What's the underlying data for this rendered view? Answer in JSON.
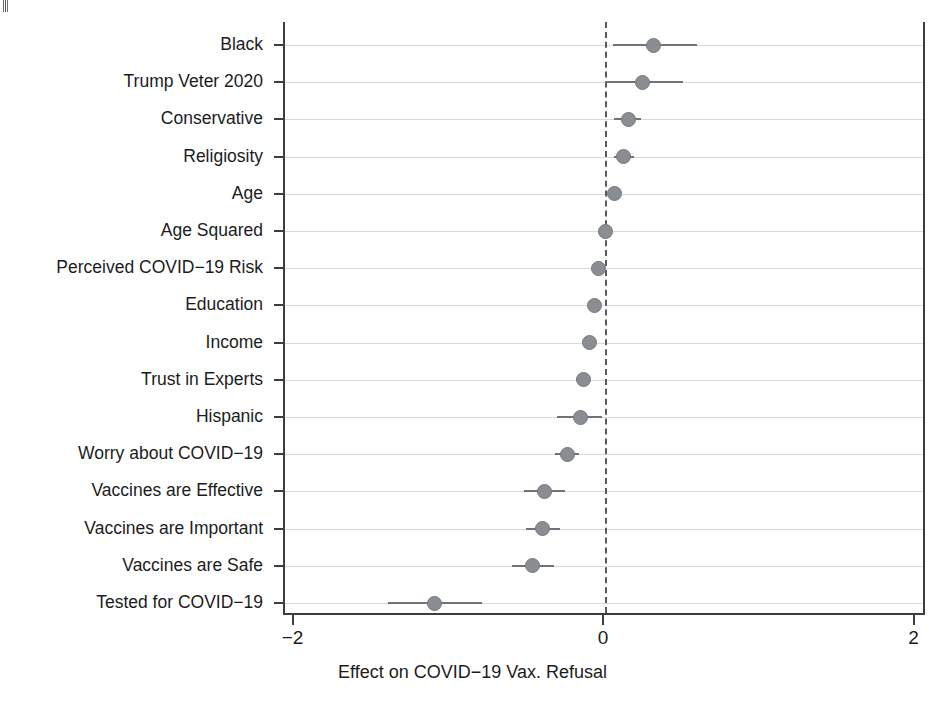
{
  "chart_data": {
    "type": "scatter",
    "title": "",
    "subtitle": "",
    "xlabel": "Effect on COVID−19 Vax. Refusal",
    "ylabel": "",
    "xlim": [
      -2.3,
      2.07
    ],
    "ylim": [
      0,
      16
    ],
    "xticks": [
      -2,
      0,
      2
    ],
    "xticklabels": [
      "−2",
      "0",
      "2"
    ],
    "grid": "horizontal",
    "legend": "none",
    "reference_line": {
      "x": 0,
      "style": "dashed"
    },
    "orientation": "horizontal",
    "categories": [
      "Black",
      "Trump Veter 2020",
      "Conservative",
      "Religiosity",
      "Age",
      "Age Squared",
      "Perceived COVID−19 Risk",
      "Education",
      "Income",
      "Trust in Experts",
      "Hispanic",
      "Worry about COVID−19",
      "Vaccines are Effective",
      "Vaccines are Important",
      "Vaccines are Safe",
      "Tested for COVID−19"
    ],
    "estimates": [
      0.31,
      0.24,
      0.15,
      0.12,
      0.06,
      0.0,
      -0.04,
      -0.07,
      -0.1,
      -0.14,
      -0.16,
      -0.24,
      -0.39,
      -0.4,
      -0.47,
      -1.1
    ],
    "ci_low": [
      0.05,
      0.0,
      0.06,
      0.06,
      0.02,
      -0.01,
      -0.06,
      -0.09,
      -0.13,
      -0.19,
      -0.31,
      -0.32,
      -0.52,
      -0.51,
      -0.6,
      -1.4
    ],
    "ci_high": [
      0.59,
      0.5,
      0.23,
      0.19,
      0.1,
      0.02,
      -0.01,
      -0.05,
      -0.07,
      -0.1,
      -0.02,
      -0.17,
      -0.26,
      -0.29,
      -0.33,
      -0.79
    ],
    "point_color": "#8a8d91",
    "line_color": "#6f7277",
    "grid_color": "#c9ccd2",
    "axis_color": "#3d3d3d"
  }
}
